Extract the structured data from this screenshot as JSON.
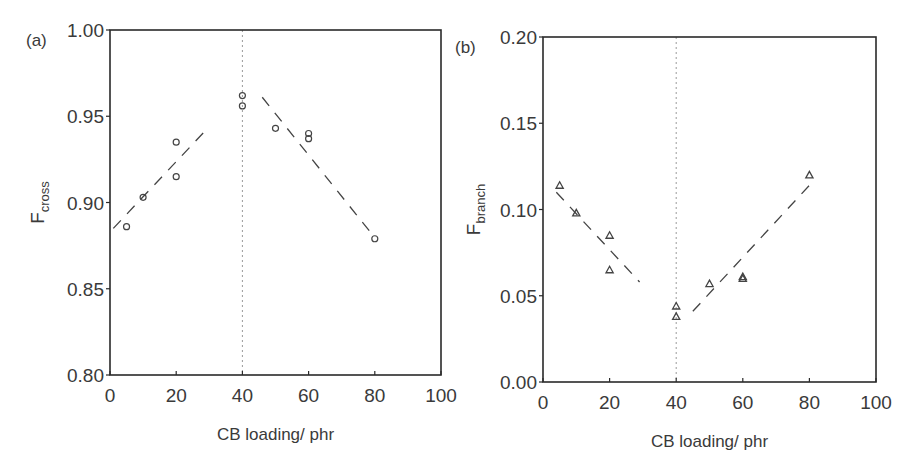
{
  "chart_data": [
    {
      "type": "scatter",
      "panel_label": "(a)",
      "title": "",
      "xlabel": "CB loading/ phr",
      "ylabel": "F",
      "ylabel_subscript": "cross",
      "xlim": [
        0,
        100
      ],
      "ylim": [
        0.8,
        1.0
      ],
      "xticks": [
        0,
        20,
        40,
        60,
        80,
        100
      ],
      "xtick_labels": [
        "0",
        "20",
        "40",
        "60",
        "80",
        "100"
      ],
      "yticks": [
        0.8,
        0.85,
        0.9,
        0.95,
        1.0
      ],
      "ytick_labels": [
        "0.80",
        "0.85",
        "0.90",
        "0.95",
        "1.00"
      ],
      "grid": false,
      "marker": "circle",
      "series": [
        {
          "name": "F_cross",
          "x": [
            5,
            10,
            20,
            20,
            40,
            40,
            50,
            60,
            60,
            80
          ],
          "y": [
            0.886,
            0.903,
            0.935,
            0.915,
            0.962,
            0.956,
            0.943,
            0.94,
            0.937,
            0.879
          ]
        }
      ],
      "trend_lines": [
        {
          "style": "dashed",
          "x": [
            1,
            29
          ],
          "y": [
            0.885,
            0.942
          ]
        },
        {
          "style": "dashed",
          "x": [
            46,
            79
          ],
          "y": [
            0.961,
            0.882
          ]
        }
      ],
      "reference_line": {
        "style": "dotted",
        "orientation": "vertical",
        "x": 40
      }
    },
    {
      "type": "scatter",
      "panel_label": "(b)",
      "title": "",
      "xlabel": "CB loading/ phr",
      "ylabel": "F",
      "ylabel_subscript": "branch",
      "xlim": [
        0,
        100
      ],
      "ylim": [
        0.0,
        0.2
      ],
      "xticks": [
        0,
        20,
        40,
        60,
        80,
        100
      ],
      "xtick_labels": [
        "0",
        "20",
        "40",
        "60",
        "80",
        "100"
      ],
      "yticks": [
        0.0,
        0.05,
        0.1,
        0.15,
        0.2
      ],
      "ytick_labels": [
        "0.00",
        "0.05",
        "0.10",
        "0.15",
        "0.20"
      ],
      "grid": false,
      "marker": "triangle",
      "series": [
        {
          "name": "F_branch",
          "x": [
            5,
            10,
            20,
            20,
            40,
            40,
            50,
            60,
            60,
            80
          ],
          "y": [
            0.114,
            0.098,
            0.085,
            0.065,
            0.044,
            0.038,
            0.057,
            0.061,
            0.06,
            0.12
          ]
        }
      ],
      "trend_lines": [
        {
          "style": "dashed",
          "x": [
            4,
            29
          ],
          "y": [
            0.11,
            0.058
          ]
        },
        {
          "style": "dashed",
          "x": [
            45,
            80
          ],
          "y": [
            0.041,
            0.114
          ]
        }
      ],
      "reference_line": {
        "style": "dotted",
        "orientation": "vertical",
        "x": 40
      }
    }
  ],
  "colors": {
    "axis": "#2a2a2a",
    "marker": "#444444",
    "trend": "#444444",
    "reference": "#9a9a9a"
  }
}
